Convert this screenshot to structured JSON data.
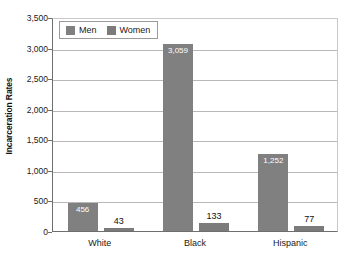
{
  "chart_data": {
    "type": "bar",
    "title": "",
    "xlabel": "",
    "ylabel": "Incarceration Rates",
    "categories": [
      "White",
      "Black",
      "Hispanic"
    ],
    "series": [
      {
        "name": "Men",
        "values": [
          456,
          3059,
          1252
        ],
        "labels": [
          "456",
          "3,059",
          "1,252"
        ],
        "color": "#808080"
      },
      {
        "name": "Women",
        "values": [
          43,
          133,
          77
        ],
        "labels": [
          "43",
          "133",
          "77"
        ],
        "color": "#7b7b7b"
      }
    ],
    "ylim": [
      0,
      3500
    ],
    "y_ticks": [
      0,
      500,
      1000,
      1500,
      2000,
      2500,
      3000,
      3500
    ],
    "y_tick_labels": [
      "0",
      "500",
      "1,000",
      "1,500",
      "2,000",
      "2,500",
      "3,000",
      "3,500"
    ],
    "grid": true,
    "legend_position": "top-left"
  },
  "legend": {
    "entries": [
      {
        "label": "Men",
        "color": "#808080"
      },
      {
        "label": "Women",
        "color": "#7b7b7b"
      }
    ]
  },
  "axes": {
    "y_title": "Incarceration Rates"
  }
}
